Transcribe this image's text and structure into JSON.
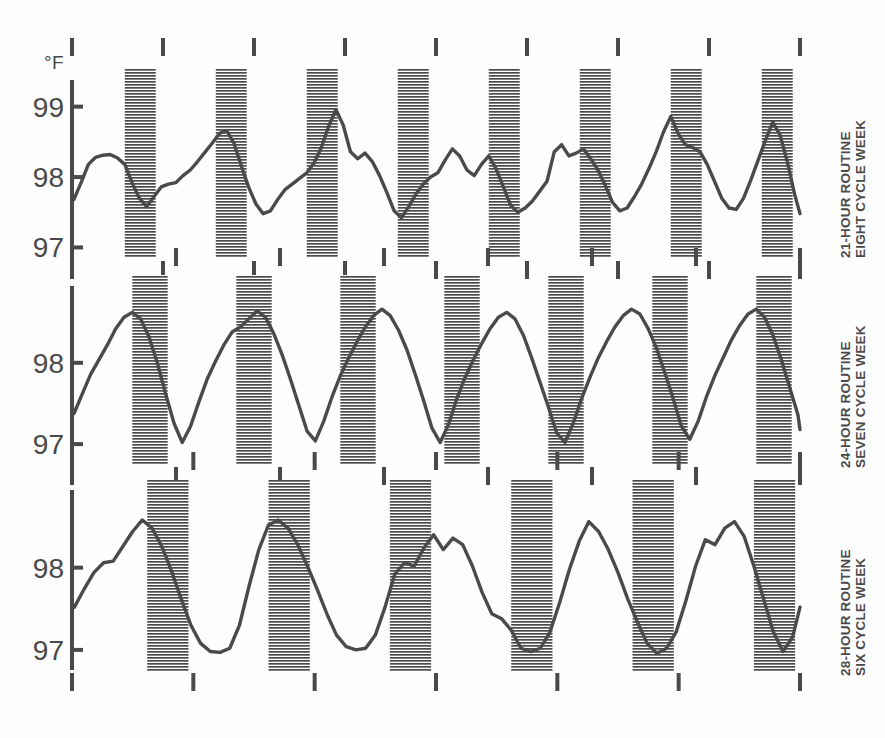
{
  "figure": {
    "unit_label": "°F",
    "background": "#fefefe",
    "ink_color": "#4a4a4a",
    "width": 885,
    "height": 738
  },
  "chart_data": {
    "type": "line",
    "title": "",
    "subtitle": "",
    "xlabel": "",
    "ylabel": "°F",
    "grid": false,
    "legend": "none",
    "shaded_band_meaning": "sleep period (hatched)",
    "panels": [
      {
        "id": "panel-21-hour",
        "label_line1": "21-HOUR ROUTINE",
        "label_line2": "EIGHT CYCLE WEEK",
        "routine_hours": 21,
        "cycles": 8,
        "ylim": [
          96.85,
          99.35
        ],
        "yticks": [
          97,
          98,
          99
        ],
        "ytick_labels": [
          "97",
          "98",
          "99"
        ],
        "xlim": [
          0,
          8
        ],
        "xticks": [
          0,
          1,
          2,
          3,
          4,
          5,
          6,
          7,
          8
        ],
        "sleep_bands": [
          [
            0.58,
            0.92
          ],
          [
            1.58,
            1.92
          ],
          [
            2.58,
            2.92
          ],
          [
            3.58,
            3.92
          ],
          [
            4.58,
            4.92
          ],
          [
            5.58,
            5.92
          ],
          [
            6.58,
            6.92
          ],
          [
            7.58,
            7.92
          ]
        ],
        "x": [
          0.02,
          0.1,
          0.18,
          0.26,
          0.34,
          0.42,
          0.5,
          0.58,
          0.66,
          0.74,
          0.82,
          0.9,
          0.98,
          1.06,
          1.14,
          1.22,
          1.3,
          1.38,
          1.46,
          1.54,
          1.62,
          1.7,
          1.78,
          1.86,
          1.94,
          2.02,
          2.1,
          2.18,
          2.26,
          2.34,
          2.42,
          2.5,
          2.58,
          2.66,
          2.74,
          2.82,
          2.9,
          2.98,
          3.06,
          3.14,
          3.22,
          3.3,
          3.38,
          3.46,
          3.54,
          3.62,
          3.7,
          3.78,
          3.86,
          3.94,
          4.02,
          4.1,
          4.18,
          4.26,
          4.34,
          4.42,
          4.5,
          4.58,
          4.66,
          4.74,
          4.82,
          4.9,
          4.98,
          5.06,
          5.14,
          5.22,
          5.3,
          5.38,
          5.46,
          5.54,
          5.62,
          5.7,
          5.78,
          5.86,
          5.94,
          6.02,
          6.1,
          6.18,
          6.26,
          6.34,
          6.42,
          6.5,
          6.58,
          6.66,
          6.74,
          6.82,
          6.9,
          6.98,
          7.06,
          7.14,
          7.22,
          7.3,
          7.38,
          7.46,
          7.54,
          7.62,
          7.7,
          7.78,
          7.86,
          7.94,
          8.0
        ],
        "y": [
          97.68,
          97.92,
          98.18,
          98.28,
          98.31,
          98.32,
          98.27,
          98.18,
          97.92,
          97.7,
          97.58,
          97.72,
          97.86,
          97.9,
          97.92,
          98.02,
          98.1,
          98.22,
          98.35,
          98.48,
          98.62,
          98.66,
          98.48,
          98.16,
          97.86,
          97.62,
          97.48,
          97.52,
          97.68,
          97.82,
          97.9,
          97.98,
          98.06,
          98.2,
          98.42,
          98.72,
          98.96,
          98.74,
          98.36,
          98.26,
          98.34,
          98.22,
          98.02,
          97.78,
          97.52,
          97.42,
          97.58,
          97.76,
          97.9,
          98.0,
          98.06,
          98.24,
          98.4,
          98.3,
          98.1,
          98.02,
          98.18,
          98.3,
          98.12,
          97.86,
          97.6,
          97.5,
          97.56,
          97.66,
          97.8,
          97.94,
          98.36,
          98.46,
          98.3,
          98.34,
          98.4,
          98.26,
          98.1,
          97.88,
          97.64,
          97.52,
          97.56,
          97.72,
          97.9,
          98.12,
          98.36,
          98.64,
          98.86,
          98.62,
          98.46,
          98.42,
          98.36,
          98.18,
          97.94,
          97.7,
          97.56,
          97.54,
          97.7,
          97.96,
          98.24,
          98.52,
          98.78,
          98.6,
          98.22,
          97.76,
          97.48,
          97.66
        ]
      },
      {
        "id": "panel-24-hour",
        "label_line1": "24-HOUR ROUTINE",
        "label_line2": "SEVEN CYCLE WEEK",
        "routine_hours": 24,
        "cycles": 7,
        "ylim": [
          96.78,
          98.92
        ],
        "yticks": [
          97,
          98
        ],
        "ytick_labels": [
          "97",
          "98"
        ],
        "xlim": [
          0,
          7
        ],
        "xticks": [
          0,
          1,
          2,
          3,
          4,
          5,
          6,
          7
        ],
        "sleep_bands": [
          [
            0.58,
            0.92
          ],
          [
            1.58,
            1.92
          ],
          [
            2.58,
            2.92
          ],
          [
            3.58,
            3.92
          ],
          [
            4.58,
            4.92
          ],
          [
            5.58,
            5.92
          ],
          [
            6.58,
            6.92
          ]
        ],
        "x": [
          0.02,
          0.1,
          0.18,
          0.26,
          0.34,
          0.42,
          0.5,
          0.58,
          0.66,
          0.74,
          0.82,
          0.9,
          0.98,
          1.06,
          1.14,
          1.22,
          1.3,
          1.38,
          1.46,
          1.54,
          1.62,
          1.7,
          1.78,
          1.86,
          1.94,
          2.02,
          2.1,
          2.18,
          2.26,
          2.34,
          2.42,
          2.5,
          2.58,
          2.66,
          2.74,
          2.82,
          2.9,
          2.98,
          3.06,
          3.14,
          3.22,
          3.3,
          3.38,
          3.46,
          3.54,
          3.62,
          3.7,
          3.78,
          3.86,
          3.94,
          4.02,
          4.1,
          4.18,
          4.26,
          4.34,
          4.42,
          4.5,
          4.58,
          4.66,
          4.74,
          4.82,
          4.9,
          4.98,
          5.06,
          5.14,
          5.22,
          5.3,
          5.38,
          5.46,
          5.54,
          5.62,
          5.7,
          5.78,
          5.86,
          5.94,
          6.02,
          6.1,
          6.18,
          6.26,
          6.34,
          6.42,
          6.5,
          6.58,
          6.66,
          6.74,
          6.82,
          6.9,
          6.98,
          7.0
        ],
        "y": [
          97.38,
          97.62,
          97.86,
          98.04,
          98.22,
          98.42,
          98.56,
          98.62,
          98.54,
          98.32,
          98.0,
          97.62,
          97.26,
          97.02,
          97.22,
          97.52,
          97.8,
          98.02,
          98.22,
          98.38,
          98.44,
          98.54,
          98.64,
          98.56,
          98.36,
          98.1,
          97.8,
          97.48,
          97.16,
          97.04,
          97.28,
          97.58,
          97.84,
          98.06,
          98.26,
          98.44,
          98.58,
          98.66,
          98.58,
          98.4,
          98.16,
          97.86,
          97.54,
          97.2,
          97.02,
          97.24,
          97.56,
          97.82,
          98.04,
          98.24,
          98.42,
          98.56,
          98.62,
          98.54,
          98.34,
          98.06,
          97.76,
          97.46,
          97.14,
          97.02,
          97.26,
          97.56,
          97.82,
          98.06,
          98.26,
          98.44,
          98.58,
          98.66,
          98.6,
          98.42,
          98.18,
          97.88,
          97.56,
          97.22,
          97.06,
          97.28,
          97.58,
          97.84,
          98.06,
          98.28,
          98.46,
          98.6,
          98.66,
          98.56,
          98.34,
          98.04,
          97.7,
          97.36,
          97.18,
          97.3
        ]
      },
      {
        "id": "panel-28-hour",
        "label_line1": "28-HOUR ROUTINE",
        "label_line2": "SIX CYCLE WEEK",
        "routine_hours": 28,
        "cycles": 6,
        "ylim": [
          96.78,
          98.92
        ],
        "yticks": [
          97,
          98
        ],
        "ytick_labels": [
          "97",
          "98"
        ],
        "xlim": [
          0,
          6
        ],
        "xticks": [
          0,
          1,
          2,
          3,
          4,
          5,
          6
        ],
        "sleep_bands": [
          [
            0.62,
            0.96
          ],
          [
            1.62,
            1.96
          ],
          [
            2.62,
            2.96
          ],
          [
            3.62,
            3.96
          ],
          [
            4.62,
            4.96
          ],
          [
            5.62,
            5.96
          ]
        ],
        "x": [
          0.02,
          0.1,
          0.18,
          0.26,
          0.34,
          0.42,
          0.5,
          0.58,
          0.66,
          0.74,
          0.82,
          0.9,
          0.98,
          1.06,
          1.14,
          1.22,
          1.3,
          1.38,
          1.46,
          1.54,
          1.62,
          1.7,
          1.78,
          1.86,
          1.94,
          2.02,
          2.1,
          2.18,
          2.26,
          2.34,
          2.42,
          2.5,
          2.58,
          2.66,
          2.74,
          2.82,
          2.9,
          2.98,
          3.06,
          3.14,
          3.22,
          3.3,
          3.38,
          3.46,
          3.54,
          3.62,
          3.7,
          3.78,
          3.86,
          3.94,
          4.02,
          4.1,
          4.18,
          4.26,
          4.34,
          4.42,
          4.5,
          4.58,
          4.66,
          4.74,
          4.82,
          4.9,
          4.98,
          5.06,
          5.14,
          5.22,
          5.3,
          5.38,
          5.46,
          5.54,
          5.62,
          5.7,
          5.78,
          5.86,
          5.94,
          6.0
        ],
        "y": [
          97.52,
          97.74,
          97.94,
          98.06,
          98.08,
          98.26,
          98.44,
          98.58,
          98.48,
          98.26,
          97.96,
          97.62,
          97.3,
          97.08,
          96.98,
          96.97,
          97.02,
          97.3,
          97.78,
          98.22,
          98.52,
          98.58,
          98.48,
          98.28,
          98.02,
          97.74,
          97.44,
          97.18,
          97.04,
          97.0,
          97.02,
          97.18,
          97.52,
          97.92,
          98.06,
          98.02,
          98.24,
          98.4,
          98.22,
          98.36,
          98.28,
          98.02,
          97.7,
          97.44,
          97.38,
          97.24,
          97.02,
          96.98,
          97.02,
          97.22,
          97.58,
          97.98,
          98.32,
          98.56,
          98.44,
          98.22,
          97.94,
          97.62,
          97.34,
          97.08,
          96.96,
          97.02,
          97.22,
          97.6,
          98.02,
          98.34,
          98.28,
          98.48,
          98.56,
          98.38,
          98.02,
          97.62,
          97.22,
          96.98,
          97.16,
          97.52
        ]
      }
    ]
  }
}
